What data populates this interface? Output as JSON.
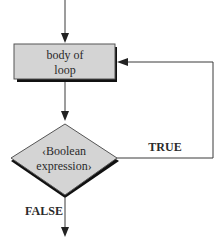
{
  "diagram": {
    "type": "flowchart",
    "nodes": [
      {
        "id": "body",
        "shape": "rectangle",
        "label_lines": [
          "body of",
          "loop"
        ],
        "fill": "#d4d4d4"
      },
      {
        "id": "cond",
        "shape": "diamond",
        "label_lines": [
          "<Boolean",
          "expression>"
        ],
        "fill": "#d4d4d4"
      }
    ],
    "edges": [
      {
        "from": "entry",
        "to": "body",
        "label": ""
      },
      {
        "from": "body",
        "to": "cond",
        "label": ""
      },
      {
        "from": "cond",
        "to": "body",
        "label": "TRUE"
      },
      {
        "from": "cond",
        "to": "exit",
        "label": "FALSE"
      }
    ],
    "labels": {
      "body_line1": "body of",
      "body_line2": "loop",
      "cond_line1": "‹Boolean",
      "cond_line2": "expression›",
      "true": "TRUE",
      "false": "FALSE"
    },
    "colors": {
      "shape_fill": "#d4d4d4",
      "line": "#3a3a3a",
      "shadow": "#111111"
    }
  }
}
